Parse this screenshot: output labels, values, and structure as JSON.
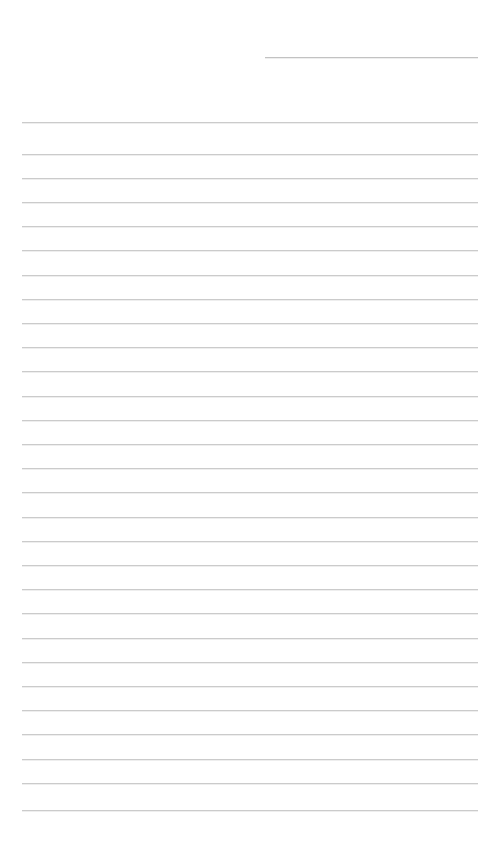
{
  "document": {
    "type": "lined-paper",
    "title": "",
    "page_width": 499,
    "page_height": 841,
    "background_color": "#ffffff",
    "orientation": "portrait"
  },
  "header": {
    "rule": {
      "name": "header-entry-rule",
      "x": 265,
      "y": 57,
      "width": 213,
      "color": "#c2c2c2",
      "thickness": 1,
      "filled_text": "",
      "placeholder": ""
    }
  },
  "body": {
    "rule_style": {
      "color": "#cbcbcb",
      "thickness": 1,
      "left": 22,
      "right": 478,
      "width": 456,
      "spacing": 24.2,
      "first_y": 122,
      "count": 29
    },
    "lines": [
      {
        "index": 1,
        "y": 122.0,
        "text": ""
      },
      {
        "index": 2,
        "y": 153.5,
        "text": ""
      },
      {
        "index": 3,
        "y": 177.7,
        "text": ""
      },
      {
        "index": 4,
        "y": 201.9,
        "text": ""
      },
      {
        "index": 5,
        "y": 226.1,
        "text": ""
      },
      {
        "index": 6,
        "y": 250.3,
        "text": ""
      },
      {
        "index": 7,
        "y": 274.5,
        "text": ""
      },
      {
        "index": 8,
        "y": 298.7,
        "text": ""
      },
      {
        "index": 9,
        "y": 322.9,
        "text": ""
      },
      {
        "index": 10,
        "y": 347.1,
        "text": ""
      },
      {
        "index": 11,
        "y": 371.3,
        "text": ""
      },
      {
        "index": 12,
        "y": 395.5,
        "text": ""
      },
      {
        "index": 13,
        "y": 419.7,
        "text": ""
      },
      {
        "index": 14,
        "y": 443.9,
        "text": ""
      },
      {
        "index": 15,
        "y": 468.1,
        "text": ""
      },
      {
        "index": 16,
        "y": 492.3,
        "text": ""
      },
      {
        "index": 17,
        "y": 516.5,
        "text": ""
      },
      {
        "index": 18,
        "y": 540.7,
        "text": ""
      },
      {
        "index": 19,
        "y": 564.9,
        "text": ""
      },
      {
        "index": 20,
        "y": 589.1,
        "text": ""
      },
      {
        "index": 21,
        "y": 613.3,
        "text": ""
      },
      {
        "index": 22,
        "y": 637.5,
        "text": ""
      },
      {
        "index": 23,
        "y": 661.7,
        "text": ""
      },
      {
        "index": 24,
        "y": 685.9,
        "text": ""
      },
      {
        "index": 25,
        "y": 710.1,
        "text": ""
      },
      {
        "index": 26,
        "y": 734.3,
        "text": ""
      },
      {
        "index": 27,
        "y": 758.5,
        "text": ""
      },
      {
        "index": 28,
        "y": 782.7,
        "text": ""
      },
      {
        "index": 29,
        "y": 810.0,
        "text": ""
      }
    ]
  }
}
